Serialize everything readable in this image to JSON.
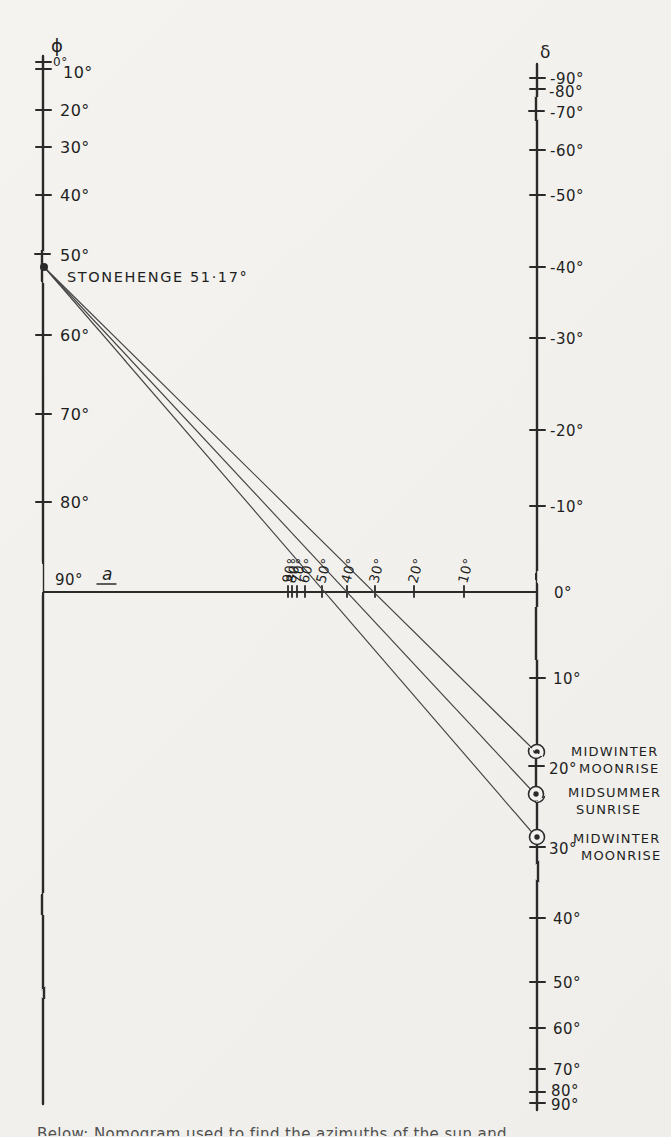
{
  "paper": {
    "bg": "#f2f1ed",
    "ink": "#2b2b2b",
    "thin_line_ink": "#454545"
  },
  "phi_axis": {
    "symbol": "ϕ",
    "symbol_pos": {
      "x": 51,
      "y": 52
    },
    "x": 43,
    "y_top": 56,
    "y_bottom": 1104,
    "ticks": [
      {
        "label": "0°",
        "y": 62,
        "lx": 53,
        "ly": 66,
        "size": 12
      },
      {
        "label": "10°",
        "y": 69,
        "lx": 63,
        "ly": 78,
        "size": 16
      },
      {
        "label": "20°",
        "y": 110,
        "lx": 60,
        "ly": 116,
        "size": 16
      },
      {
        "label": "30°",
        "y": 147,
        "lx": 60,
        "ly": 153,
        "size": 16
      },
      {
        "label": "40°",
        "y": 195,
        "lx": 60,
        "ly": 201,
        "size": 16
      },
      {
        "label": "50°",
        "y": 255,
        "lx": 60,
        "ly": 261,
        "size": 16
      },
      {
        "label": "60°",
        "y": 335,
        "lx": 60,
        "ly": 341,
        "size": 16
      },
      {
        "label": "70°",
        "y": 414,
        "lx": 60,
        "ly": 420,
        "size": 16
      },
      {
        "label": "80°",
        "y": 502,
        "lx": 60,
        "ly": 508,
        "size": 16
      }
    ],
    "corner_label": {
      "text": "90°",
      "x": 55,
      "y": 585,
      "size": 15
    }
  },
  "delta_axis": {
    "symbol": "δ",
    "symbol_pos": {
      "x": 540,
      "y": 58
    },
    "x": 537,
    "y_top": 64,
    "y_bottom": 1110,
    "ticks": [
      {
        "label": "-90°",
        "y": 78,
        "lx": 550,
        "ly": 84
      },
      {
        "label": "-80°",
        "y": 89,
        "lx": 549,
        "ly": 97
      },
      {
        "label": "-70°",
        "y": 112,
        "lx": 550,
        "ly": 118
      },
      {
        "label": "-60°",
        "y": 150,
        "lx": 550,
        "ly": 156
      },
      {
        "label": "-50°",
        "y": 195,
        "lx": 550,
        "ly": 201
      },
      {
        "label": "-40°",
        "y": 267,
        "lx": 550,
        "ly": 273
      },
      {
        "label": "-30°",
        "y": 338,
        "lx": 550,
        "ly": 344
      },
      {
        "label": "-20°",
        "y": 430,
        "lx": 550,
        "ly": 436
      },
      {
        "label": "-10°",
        "y": 506,
        "lx": 550,
        "ly": 512
      },
      {
        "label": "0°",
        "y": null,
        "lx": 554,
        "ly": 598
      },
      {
        "label": "10°",
        "y": 678,
        "lx": 553,
        "ly": 684
      },
      {
        "label": "20°",
        "y": 767,
        "lx": 549,
        "ly": 774
      },
      {
        "label": "30°",
        "y": 847,
        "lx": 549,
        "ly": 854
      },
      {
        "label": "40°",
        "y": 918,
        "lx": 553,
        "ly": 924
      },
      {
        "label": "50°",
        "y": 982,
        "lx": 553,
        "ly": 988
      },
      {
        "label": "60°",
        "y": 1028,
        "lx": 553,
        "ly": 1034
      },
      {
        "label": "70°",
        "y": 1069,
        "lx": 553,
        "ly": 1075
      },
      {
        "label": "80°",
        "y": 1092,
        "lx": 551,
        "ly": 1096
      },
      {
        "label": "90°",
        "y": 1103,
        "lx": 551,
        "ly": 1110
      }
    ]
  },
  "azimuth_axis": {
    "label": "a",
    "label_pos": {
      "x": 102,
      "y": 580
    },
    "y": 592,
    "x_left": 43,
    "x_right": 537,
    "ticks": [
      {
        "label": "90°",
        "x": 288
      },
      {
        "label": "80°",
        "x": 292
      },
      {
        "label": "70°",
        "x": 297
      },
      {
        "label": "60°",
        "x": 305
      },
      {
        "label": "50°",
        "x": 322
      },
      {
        "label": "40°",
        "x": 347
      },
      {
        "label": "30°",
        "x": 375
      },
      {
        "label": "20°",
        "x": 414
      },
      {
        "label": "10°",
        "x": 464
      }
    ]
  },
  "source_point": {
    "label": "STONEHENGE 51·17°",
    "x": 45,
    "y": 268,
    "label_x": 67,
    "label_y": 282
  },
  "alignments": [
    {
      "delta_y": 752,
      "azimuth_cross_x": 375,
      "result_lines": [
        {
          "t": "MIDWINTER",
          "x": 571,
          "y": 756
        },
        {
          "t": "MOONRISE",
          "x": 579,
          "y": 773
        }
      ]
    },
    {
      "delta_y": 795,
      "azimuth_cross_x": 347,
      "result_lines": [
        {
          "t": "MIDSUMMER",
          "x": 568,
          "y": 797
        },
        {
          "t": "SUNRISE",
          "x": 576,
          "y": 814
        }
      ]
    },
    {
      "delta_y": 837,
      "azimuth_cross_x": 322,
      "result_lines": [
        {
          "t": "MIDWINTER",
          "x": 573,
          "y": 843
        },
        {
          "t": "MOONRISE",
          "x": 581,
          "y": 860
        }
      ]
    }
  ],
  "bottom_caption": "Below: Nomogram used to find the azimuths of the sun and moon",
  "chart_data": {
    "type": "line",
    "left_axis": {
      "label": "ϕ",
      "ticks_deg": [
        0,
        10,
        20,
        30,
        40,
        50,
        60,
        70,
        80,
        90
      ],
      "scale": "cosine"
    },
    "right_axis": {
      "label": "δ",
      "ticks_deg": [
        -90,
        -80,
        -70,
        -60,
        -50,
        -40,
        -30,
        -20,
        -10,
        0,
        10,
        20,
        30,
        40,
        50,
        60,
        70,
        80,
        90
      ],
      "scale": "sine"
    },
    "bottom_axis": {
      "label": "a",
      "ticks_deg": [
        90,
        80,
        70,
        60,
        50,
        40,
        30,
        20,
        10
      ]
    },
    "series": [
      {
        "name": "MIDWINTER MOONRISE (north extreme)",
        "latitude_deg": 51.17,
        "azimuth_deg": 30,
        "declination_deg": 18.5
      },
      {
        "name": "MIDSUMMER SUNRISE",
        "latitude_deg": 51.17,
        "azimuth_deg": 40,
        "declination_deg": 23.5
      },
      {
        "name": "MIDWINTER MOONRISE (south extreme)",
        "latitude_deg": 51.17,
        "azimuth_deg": 50,
        "declination_deg": 28.5
      }
    ],
    "annotations": [
      "STONEHENGE 51·17°"
    ]
  }
}
